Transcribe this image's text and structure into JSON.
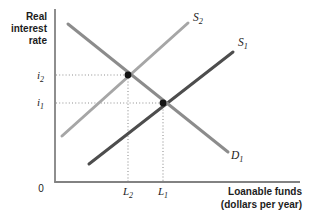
{
  "figure": {
    "labels": {
      "y_axis_title": "Real\ninterest\nrate",
      "x_axis_title": "Loanable funds\n(dollars per year)",
      "origin": "0",
      "i2": {
        "main": "i",
        "sub": "2"
      },
      "i1": {
        "main": "i",
        "sub": "1"
      },
      "L2": {
        "main": "L",
        "sub": "2"
      },
      "L1": {
        "main": "L",
        "sub": "1"
      },
      "S2": {
        "main": "S",
        "sub": "2"
      },
      "S1": {
        "main": "S",
        "sub": "1"
      },
      "D1": {
        "main": "D",
        "sub": "1"
      }
    },
    "colors": {
      "supply_s2": "#a6a6a6",
      "supply_s1": "#4d4d4d",
      "demand_d1": "#8c8c8c",
      "axis": "#828282",
      "guide": "#909090",
      "dot": "#141414",
      "text": "#1c1c1c"
    }
  },
  "chart_data": {
    "type": "line",
    "title": "",
    "xlabel": "Loanable funds (dollars per year)",
    "ylabel": "Real interest rate",
    "x_tick_labels": [
      "0",
      "L2",
      "L1"
    ],
    "y_tick_labels": [
      "i2",
      "i1"
    ],
    "legend": "none",
    "grid": false,
    "axes": {
      "x0": 55,
      "y0": 182,
      "x_end": 300,
      "y_top": 9
    },
    "axis_color": "#828282",
    "guide_color": "#909090",
    "dot_color": "#141414",
    "dot_radius": 3.4,
    "series": [
      {
        "name": "S2",
        "kind": "supply",
        "color": "#a6a6a6",
        "width": 3,
        "points": [
          [
            62,
            136
          ],
          [
            188,
            23
          ]
        ]
      },
      {
        "name": "S1",
        "kind": "supply",
        "color": "#4d4d4d",
        "width": 3,
        "points": [
          [
            89,
            164
          ],
          [
            233,
            52
          ]
        ]
      },
      {
        "name": "D1",
        "kind": "demand",
        "color": "#8c8c8c",
        "width": 3,
        "points": [
          [
            68,
            24
          ],
          [
            228,
            152
          ]
        ]
      }
    ],
    "equilibria": [
      {
        "x": 128,
        "y": 75,
        "x_label": "L2",
        "y_label": "i2"
      },
      {
        "x": 163,
        "y": 103,
        "x_label": "L1",
        "y_label": "i1"
      }
    ]
  }
}
